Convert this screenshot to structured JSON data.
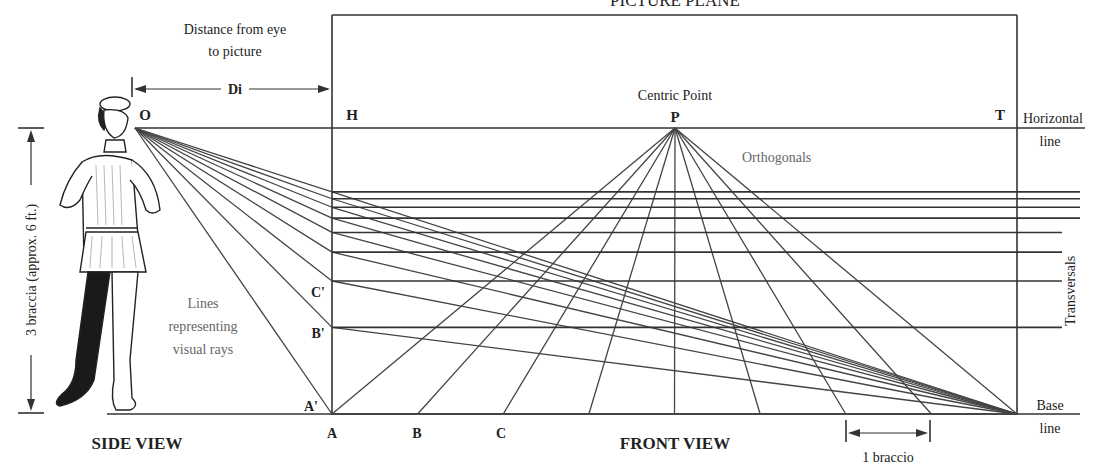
{
  "title": "PICTURE PLANE",
  "labels": {
    "distance_caption_line1": "Distance from eye",
    "distance_caption_line2": "to picture",
    "di": "Di",
    "eye_point": "O",
    "h": "H",
    "t": "T",
    "centric_point_caption": "Centric Point",
    "p": "P",
    "orthogonals": "Orthogonals",
    "horizontal_line_1": "Horizontal",
    "horizontal_line_2": "line",
    "transversals": "Transversals",
    "height_caption": "3 braccia (approx. 6 ft.)",
    "visual_rays_1": "Lines",
    "visual_rays_2": "representing",
    "visual_rays_3": "visual rays",
    "c_prime": "C'",
    "b_prime": "B'",
    "a_prime": "A'",
    "a": "A",
    "b": "B",
    "c": "C",
    "side_view": "SIDE VIEW",
    "front_view": "FRONT VIEW",
    "braccio": "1 braccio",
    "base_line_1": "Base",
    "base_line_2": "line"
  },
  "model": {
    "baseline_points_braccia": [
      0,
      1,
      2,
      3,
      4,
      5,
      6,
      7,
      8
    ],
    "transversal_count": 10,
    "figure_height_braccia": 3
  },
  "colors": {
    "line": "#333333",
    "text": "#222222",
    "muted_text": "#666666"
  }
}
